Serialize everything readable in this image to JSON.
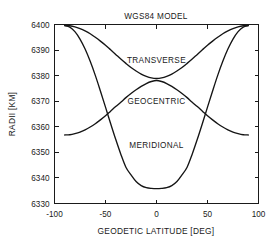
{
  "chart_data": {
    "type": "line",
    "title": "WGS84 MODEL",
    "xlabel": "GEODETIC LATITUDE [DEG]",
    "ylabel": "RADII [KM]",
    "xlim": [
      -100,
      100
    ],
    "ylim": [
      6330,
      6400
    ],
    "xticks": [
      -100,
      -50,
      0,
      50,
      100
    ],
    "xtick_labels": [
      "-100",
      "-50",
      "0",
      "50",
      "100"
    ],
    "yticks": [
      6330,
      6340,
      6350,
      6360,
      6370,
      6380,
      6390,
      6400
    ],
    "ytick_labels": [
      "6330",
      "6340",
      "6350",
      "6360",
      "6370",
      "6380",
      "6390",
      "6400"
    ],
    "grid": false,
    "legend_position": "inline-annotations",
    "x": [
      -90,
      -85,
      -80,
      -75,
      -70,
      -65,
      -60,
      -55,
      -50,
      -45,
      -40,
      -35,
      -30,
      -25,
      -20,
      -15,
      -10,
      -5,
      0,
      5,
      10,
      15,
      20,
      25,
      30,
      35,
      40,
      45,
      50,
      55,
      60,
      65,
      70,
      75,
      80,
      85,
      90
    ],
    "series": [
      {
        "name": "TRANSVERSE",
        "label_x": 0,
        "label_y": 6386,
        "values": [
          6399.6,
          6399.5,
          6399.1,
          6398.4,
          6397.5,
          6396.4,
          6395.0,
          6393.5,
          6391.9,
          6390.1,
          6388.3,
          6386.5,
          6384.8,
          6383.2,
          6381.8,
          6380.6,
          6379.7,
          6379.1,
          6378.9,
          6379.1,
          6379.7,
          6380.6,
          6381.8,
          6383.2,
          6384.8,
          6386.5,
          6388.3,
          6390.1,
          6391.9,
          6393.5,
          6395.0,
          6396.4,
          6397.5,
          6398.4,
          6399.1,
          6399.5,
          6399.6
        ]
      },
      {
        "name": "GEOCENTRIC",
        "label_x": 0,
        "label_y": 6370,
        "values": [
          6356.8,
          6356.9,
          6357.3,
          6357.9,
          6358.8,
          6359.9,
          6361.2,
          6362.7,
          6364.3,
          6366.1,
          6367.9,
          6369.6,
          6371.4,
          6373.0,
          6374.5,
          6375.8,
          6376.9,
          6377.7,
          6378.1,
          6377.7,
          6376.9,
          6375.8,
          6374.5,
          6373.0,
          6371.4,
          6369.6,
          6367.9,
          6366.1,
          6364.3,
          6362.7,
          6361.2,
          6359.9,
          6358.8,
          6357.9,
          6357.3,
          6356.9,
          6356.8
        ]
      },
      {
        "name": "MERIDIONAL",
        "label_x": 0,
        "label_y": 6353,
        "values": [
          6399.6,
          6399.0,
          6397.2,
          6394.3,
          6390.4,
          6385.6,
          6380.1,
          6374.0,
          6367.7,
          6361.3,
          6355.1,
          6349.3,
          6344.2,
          6341.2,
          6338.6,
          6337.0,
          6336.2,
          6335.9,
          6335.8,
          6335.9,
          6336.2,
          6337.0,
          6338.6,
          6341.2,
          6344.2,
          6349.3,
          6355.1,
          6361.3,
          6367.7,
          6374.0,
          6380.1,
          6385.6,
          6390.4,
          6394.3,
          6397.2,
          6399.0,
          6399.6
        ]
      }
    ],
    "colors": {
      "curve": "#151515",
      "axis": "#1a1a1a",
      "background": "#ffffff"
    }
  }
}
